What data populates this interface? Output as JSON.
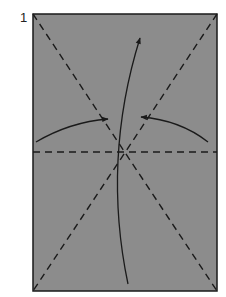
{
  "diagram": {
    "step_number": "1",
    "paper_color": "#8c8c8c",
    "line_color": "#1a1a1a"
  }
}
